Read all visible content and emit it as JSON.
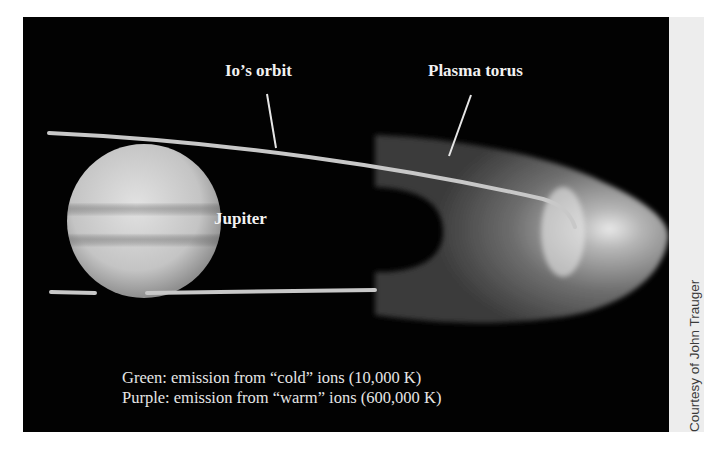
{
  "figure": {
    "labels": {
      "io_orbit": "Io’s orbit",
      "plasma_torus": "Plasma torus",
      "jupiter": "Jupiter"
    },
    "caption": {
      "line1": "Green: emission from “cold” ions (10,000 K)",
      "line2": "Purple: emission from “warm” ions (600,000 K)"
    },
    "credit": "Courtesy of John Trauger",
    "colors": {
      "background": "#020202",
      "orbit_line": "#c8c8c8",
      "jupiter": "#cfcfcf",
      "torus": "#8a8a8a",
      "text": "#f2f2f2"
    }
  }
}
